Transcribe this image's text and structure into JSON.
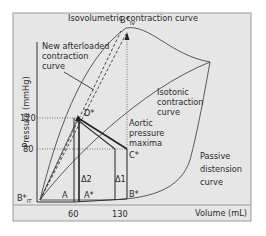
{
  "figure": {
    "colors": {
      "panel_bg": "#e6e6e6",
      "frame": "#9a9a9a",
      "ink": "#2a2a2a"
    },
    "axes": {
      "y_label": "Pressure (mmHg)",
      "x_label": "Volume (mL)",
      "y_ticks": [
        "120",
        "80"
      ],
      "x_ticks": [
        "60",
        "130"
      ]
    },
    "curves": {
      "isovolumetric": "Isovolumetric contraction curve",
      "new_afterloaded": [
        "New afterloaded",
        "contraction",
        "curve"
      ],
      "isotonic": [
        "Isotonic",
        "contraction",
        "curve"
      ],
      "passive": [
        "Passive",
        "distension",
        "curve"
      ],
      "aortic": [
        "Aortic",
        "pressure",
        "maxima"
      ]
    },
    "points": {
      "b_iv": {
        "main": "B*",
        "sub": "IV"
      },
      "b_it": {
        "main": "B*",
        "sub": "IT"
      },
      "d_star": "D*",
      "c_star": "C*",
      "b_star": "B*",
      "a": "A",
      "a_star": "A*",
      "delta1": "Δ1",
      "delta2": "Δ2"
    }
  }
}
